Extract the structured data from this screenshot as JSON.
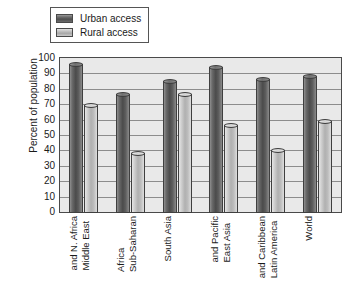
{
  "chart_data": {
    "type": "bar",
    "title": "",
    "xlabel": "",
    "ylabel": "Percent of population",
    "ylim": [
      0,
      100
    ],
    "ytick_step": 10,
    "yticks": [
      100,
      90,
      80,
      70,
      60,
      50,
      40,
      30,
      20,
      10,
      0
    ],
    "grid": true,
    "legend_position": "top-left",
    "categories": [
      "Middle East and N. Africa",
      "Sub-Saharan Africa",
      "South Asia",
      "East Asia and Pacific",
      "Latin America and Caribbean",
      "World"
    ],
    "category_lines": [
      [
        "Middle East",
        "and N. Africa"
      ],
      [
        "Sub-Saharan",
        "Africa"
      ],
      [
        "South Asia"
      ],
      [
        "East Asia",
        "and Pacific"
      ],
      [
        "Latin America",
        "and Caribbean"
      ],
      [
        "World"
      ]
    ],
    "series": [
      {
        "name": "Urban access",
        "color": "#5a5a5a",
        "values": [
          97,
          77,
          86,
          95,
          87,
          89
        ]
      },
      {
        "name": "Rural access",
        "color": "#bfbfbf",
        "values": [
          70,
          39,
          77,
          57,
          41,
          60
        ]
      }
    ]
  },
  "legend": {
    "items": [
      {
        "label": "Urban access",
        "swatch": "urban"
      },
      {
        "label": "Rural access",
        "swatch": "rural"
      }
    ]
  }
}
